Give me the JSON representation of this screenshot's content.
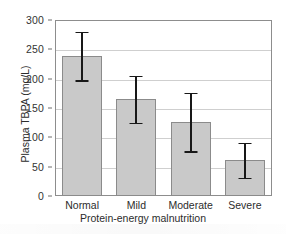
{
  "chart_data": {
    "type": "bar",
    "title": "",
    "xlabel": "Protein-energy malnutrition",
    "ylabel": "Plasma TBPA (mg/L)",
    "categories": [
      "Normal",
      "Mild",
      "Moderate",
      "Severe"
    ],
    "values": [
      238,
      166,
      126,
      61
    ],
    "error_low": [
      197,
      125,
      76,
      31
    ],
    "error_high": [
      280,
      205,
      176,
      91
    ],
    "ylim": [
      0,
      300
    ],
    "ytick_labels": [
      "0",
      "50",
      "100",
      "150",
      "200",
      "250",
      "300"
    ],
    "ytick_values": [
      0,
      50,
      100,
      150,
      200,
      250,
      300
    ],
    "grid": "horizontal",
    "legend": "none",
    "bar_color": "#c9c9c9",
    "bar_edge_color": "#8b8b8b",
    "error_color": "#181818",
    "frame_color": "#8d8d8d",
    "gridline_color": "#cfcfcf"
  }
}
